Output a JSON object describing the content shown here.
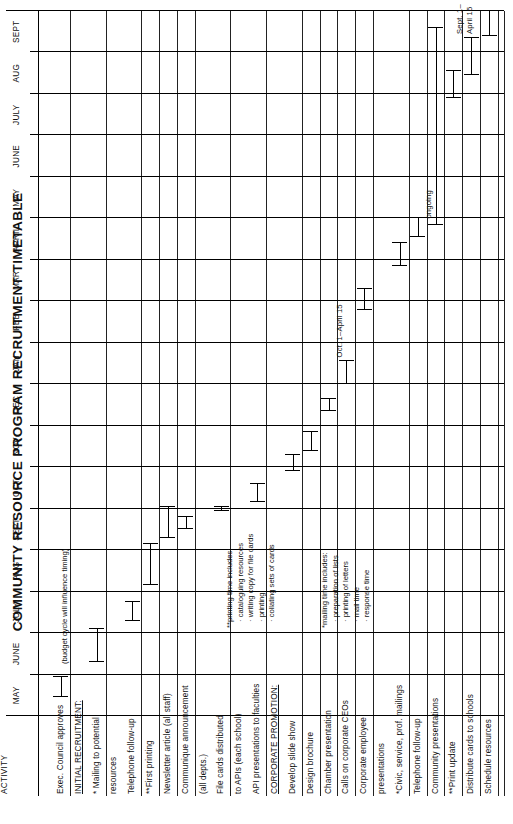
{
  "title": "COMMUNITY RESOURCE PROGRAM RECRUITMENT TIMETABLE",
  "activity_header": "ACTIVITY",
  "months": [
    "MAY",
    "JUNE",
    "JULY",
    "AUG",
    "SEPT",
    "OCT",
    "NOV",
    "DEC",
    "JAN",
    "FEB",
    "MAR",
    "APRIL",
    "MAY",
    "JUNE",
    "JULY",
    "AUG",
    "SEPT"
  ],
  "notes": {
    "budget": "(budget cycle will influence timing)",
    "ongoing": "ongoing",
    "oct_april": "Oct. 1–April 15",
    "sept_line1": "Sept. 1–",
    "sept_line2": "April 15"
  },
  "footnotes": [
    {
      "heading": "*mailing time includes:",
      "items": [
        "· preparation of lists",
        "· printing of letters",
        "· mail time",
        "· response time"
      ]
    },
    {
      "heading": "**printing time includes:",
      "items": [
        "· cataloguing resources",
        "· writing copy for file cards",
        "· printing",
        "· collating sets of cards"
      ]
    }
  ],
  "chart_data": {
    "type": "bar",
    "title": "COMMUNITY RESOURCE PROGRAM RECRUITMENT TIMETABLE",
    "xlabel": "",
    "ylabel": "ACTIVITY",
    "grid": true,
    "legend": "none",
    "categories": [
      "MAY",
      "JUNE",
      "JULY",
      "AUG",
      "SEPT",
      "OCT",
      "NOV",
      "DEC",
      "JAN",
      "FEB",
      "MAR",
      "APRIL",
      "MAY",
      "JUNE",
      "JULY",
      "AUG",
      "SEPT"
    ],
    "tasks": [
      {
        "label": "Exec. Council approves",
        "underline": false,
        "start": 0.45,
        "end": 0.95,
        "annotation": ""
      },
      {
        "label": "INITIAL RECRUITMENT:",
        "underline": true,
        "start": null,
        "end": null,
        "annotation": ""
      },
      {
        "label": "* Mailing to potential",
        "underline": false,
        "start": 1.3,
        "end": 2.1,
        "annotation": ""
      },
      {
        "label": "resources",
        "underline": false,
        "start": null,
        "end": null,
        "annotation": ""
      },
      {
        "label": "Telephone follow-up",
        "underline": false,
        "start": 2.3,
        "end": 2.75,
        "annotation": ""
      },
      {
        "label": "**First printing",
        "underline": false,
        "start": 3.15,
        "end": 4.15,
        "annotation": ""
      },
      {
        "label": "Newsletter article (all staff)",
        "underline": false,
        "start": 4.3,
        "end": 5.05,
        "annotation": ""
      },
      {
        "label": "Communique announcement",
        "underline": false,
        "start": 4.5,
        "end": 4.8,
        "annotation": ""
      },
      {
        "label": "(all depts.)",
        "underline": false,
        "start": null,
        "end": null,
        "annotation": ""
      },
      {
        "label": "File cards distributed",
        "underline": false,
        "start": 4.95,
        "end": 5.05,
        "annotation": ""
      },
      {
        "label": "to APIs (each school)",
        "underline": false,
        "start": null,
        "end": null,
        "annotation": ""
      },
      {
        "label": "API presentations to faculties",
        "underline": false,
        "start": 5.15,
        "end": 5.6,
        "annotation": ""
      },
      {
        "label": "CORPORATE PROMOTION:",
        "underline": true,
        "start": null,
        "end": null,
        "annotation": ""
      },
      {
        "label": "Develop slide show",
        "underline": false,
        "start": 5.9,
        "end": 6.3,
        "annotation": ""
      },
      {
        "label": "Design brochure",
        "underline": false,
        "start": 6.4,
        "end": 6.85,
        "annotation": ""
      },
      {
        "label": "Chamber presentation",
        "underline": false,
        "start": 7.35,
        "end": 7.65,
        "annotation": ""
      },
      {
        "label": "Calls on corporate CEOs",
        "underline": false,
        "start": 8.0,
        "end": 8.55,
        "annotation": "Oct. 1–April 15"
      },
      {
        "label": "Corporate employee",
        "underline": false,
        "start": 9.8,
        "end": 10.3,
        "annotation": ""
      },
      {
        "label": "presentations",
        "underline": false,
        "start": null,
        "end": null,
        "annotation": ""
      },
      {
        "label": "*Civic, service, prof. mailings",
        "underline": false,
        "start": 10.85,
        "end": 11.4,
        "annotation": ""
      },
      {
        "label": "Telephone follow-up",
        "underline": false,
        "start": 11.55,
        "end": 12.0,
        "annotation": ""
      },
      {
        "label": "Community presentations",
        "underline": false,
        "start": 11.85,
        "end": 16.6,
        "annotation": "ongoing"
      },
      {
        "label": "**Print update",
        "underline": false,
        "start": 14.9,
        "end": 15.55,
        "annotation": ""
      },
      {
        "label": "Distribute cards to schools",
        "underline": false,
        "start": 15.45,
        "end": 16.35,
        "annotation": "Sept. 1–April 15"
      },
      {
        "label": "Schedule resources",
        "underline": false,
        "start": 16.4,
        "end": 17.0,
        "annotation": ""
      }
    ]
  }
}
